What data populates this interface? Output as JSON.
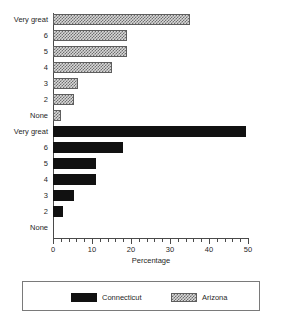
{
  "chart_data": {
    "type": "bar",
    "orientation": "horizontal",
    "title": "",
    "subtitle": "",
    "xlabel": "Percentage",
    "ylabel": "",
    "xlim": [
      0,
      50
    ],
    "xticks": [
      0,
      10,
      20,
      30,
      40,
      50
    ],
    "xtick_labels": [
      "0",
      "10",
      "20",
      "30",
      "40",
      "50"
    ],
    "minor_tick_step": 2,
    "grid": false,
    "legend_position": "bottom",
    "categories": [
      "Very great",
      "6",
      "5",
      "4",
      "3",
      "2",
      "None"
    ],
    "groups": [
      {
        "name": "Arizona",
        "fill": "hatched",
        "position": "top",
        "categories": [
          "Very great",
          "6",
          "5",
          "4",
          "3",
          "2",
          "None"
        ],
        "values": [
          35,
          19,
          19,
          15,
          6.5,
          5.5,
          2
        ]
      },
      {
        "name": "Connecticut",
        "fill": "solid",
        "position": "bottom",
        "categories": [
          "Very great",
          "6",
          "5",
          "4",
          "3",
          "2",
          "None"
        ],
        "values": [
          49.5,
          18,
          11,
          11,
          5.5,
          2.5,
          0
        ]
      }
    ],
    "series": [
      {
        "name": "Arizona",
        "values": [
          35,
          19,
          19,
          15,
          6.5,
          5.5,
          2
        ]
      },
      {
        "name": "Connecticut",
        "values": [
          49.5,
          18,
          11,
          11,
          5.5,
          2.5,
          0
        ]
      }
    ]
  },
  "legend": {
    "items": [
      {
        "label": "Connecticut",
        "swatch": "solid"
      },
      {
        "label": "Arizona",
        "swatch": "hatched"
      }
    ]
  },
  "colors": {
    "solid_fill": "#111111",
    "hatch_fill": "#d8d8d8",
    "hatch_stroke": "#6e6e6e",
    "axis": "#4a4a4a",
    "text": "#1f1f1f",
    "background": "#ffffff"
  }
}
